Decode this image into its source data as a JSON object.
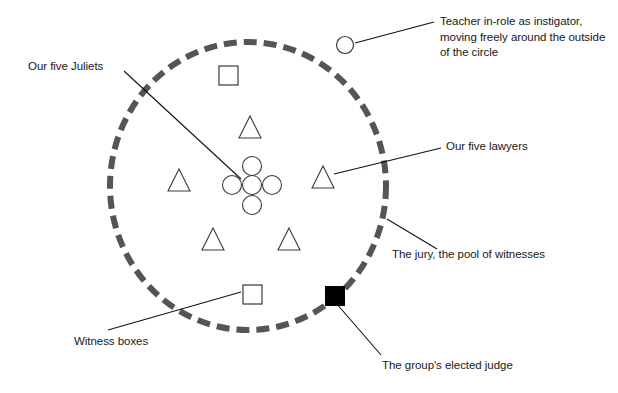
{
  "diagram": {
    "background_color": "#ffffff",
    "circle_color": "#555555",
    "shape_outline_color": "#333333",
    "judge_fill_color": "#000000",
    "leader_line_color": "#111111",
    "labels": {
      "teacher": "Teacher in-role as instigator, moving freely around the outside of the circle",
      "juliets": "Our five Juliets",
      "lawyers": "Our five lawyers",
      "jury": "The jury, the pool of witnesses",
      "witness_boxes": "Witness boxes",
      "judge": "The group's elected judge"
    },
    "shapes": {
      "outer_circle": {
        "name": "dashed-circle",
        "meaning": "The jury, the pool of witnesses",
        "center_x": 248,
        "center_y": 186,
        "radius_x": 138,
        "radius_y": 144,
        "stroke_width": 6,
        "dash": "13 7"
      },
      "juliets_cluster": {
        "name": "five-circles-plus-formation",
        "count": 5,
        "radius": 9.5,
        "positions": [
          {
            "cx": 252,
            "cy": 166
          },
          {
            "cx": 232,
            "cy": 185
          },
          {
            "cx": 252,
            "cy": 185
          },
          {
            "cx": 272,
            "cy": 185
          },
          {
            "cx": 252,
            "cy": 205
          }
        ]
      },
      "lawyers_triangles": {
        "name": "five-triangles",
        "count": 5,
        "size": 22,
        "positions": [
          {
            "cx": 250,
            "cy": 127
          },
          {
            "cx": 179,
            "cy": 180
          },
          {
            "cx": 323,
            "cy": 177
          },
          {
            "cx": 213,
            "cy": 239
          },
          {
            "cx": 289,
            "cy": 239
          }
        ]
      },
      "witness_boxes": {
        "name": "two-squares",
        "count": 2,
        "size": 19,
        "positions": [
          {
            "x": 219,
            "y": 66
          },
          {
            "x": 243,
            "y": 285
          }
        ]
      },
      "teacher_marker": {
        "name": "small-open-circle",
        "cx": 345,
        "cy": 45,
        "r": 8.5
      },
      "judge_marker": {
        "name": "filled-black-square",
        "x": 325,
        "y": 286,
        "size": 20
      }
    },
    "leader_lines": [
      {
        "name": "teacher-leader",
        "x1": 355,
        "y1": 43,
        "x2": 434,
        "y2": 22
      },
      {
        "name": "juliets-leader",
        "x1": 124,
        "y1": 71,
        "x2": 241,
        "y2": 179
      },
      {
        "name": "lawyers-leader",
        "x1": 334,
        "y1": 174,
        "x2": 441,
        "y2": 148
      },
      {
        "name": "jury-leader",
        "x1": 387,
        "y1": 219,
        "x2": 437,
        "y2": 249
      },
      {
        "name": "witness-leader",
        "x1": 108,
        "y1": 330,
        "x2": 241,
        "y2": 292
      },
      {
        "name": "judge-leader",
        "x1": 336,
        "y1": 303,
        "x2": 381,
        "y2": 355
      }
    ]
  }
}
